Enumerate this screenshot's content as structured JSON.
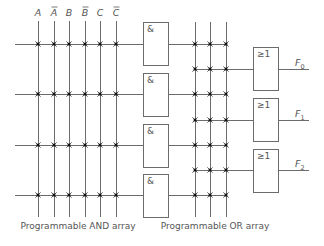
{
  "inputs": [
    {
      "label": "A",
      "bar": false
    },
    {
      "label": "A",
      "bar": true
    },
    {
      "label": "B",
      "bar": false
    },
    {
      "label": "B",
      "bar": true
    },
    {
      "label": "C",
      "bar": false
    },
    {
      "label": "C",
      "bar": true
    }
  ],
  "and_gates": [
    {
      "symbol": "&"
    },
    {
      "symbol": "&"
    },
    {
      "symbol": "&"
    },
    {
      "symbol": "&"
    }
  ],
  "or_gates": [
    {
      "symbol": "≥1",
      "output": "F",
      "sub": "0"
    },
    {
      "symbol": "≥1",
      "output": "F",
      "sub": "1"
    },
    {
      "symbol": "≥1",
      "output": "F",
      "sub": "2"
    }
  ],
  "captions": {
    "and_array": "Programmable AND array",
    "or_array": "Programmable OR array"
  },
  "colors": {
    "wire": "#6b6b6b",
    "fuse_dot": "#111111",
    "text": "#555555"
  }
}
